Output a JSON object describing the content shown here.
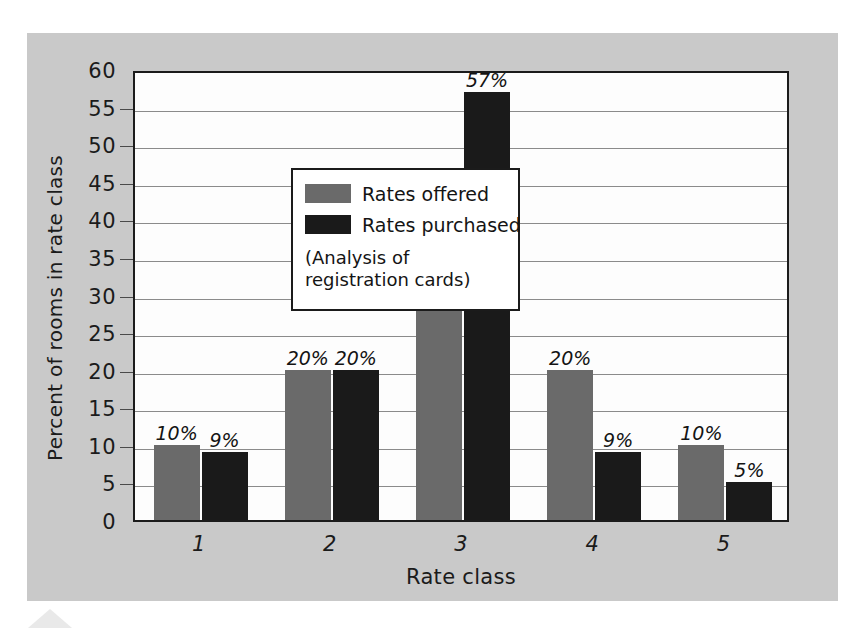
{
  "chart_data": {
    "type": "bar",
    "title": "",
    "xlabel": "Rate class",
    "ylabel": "Percent of rooms in rate class",
    "categories": [
      "1",
      "2",
      "3",
      "4",
      "5"
    ],
    "ylim": [
      0,
      60
    ],
    "ytick_step": 5,
    "yticks": [
      "60",
      "55",
      "50",
      "45",
      "40",
      "35",
      "30",
      "25",
      "20",
      "15",
      "10",
      "5",
      "0"
    ],
    "grid": true,
    "legend_position": "inside upper-left",
    "series": [
      {
        "name": "Rates offered",
        "color": "#6a6a6a",
        "values": [
          10,
          20,
          40,
          20,
          10
        ],
        "labels": [
          "10%",
          "20%",
          "40%",
          "20%",
          "10%"
        ]
      },
      {
        "name": "Rates purchased",
        "color": "#1a1a1a",
        "values": [
          9,
          20,
          57,
          9,
          5
        ],
        "labels": [
          "9%",
          "20%",
          "57%",
          "9%",
          "5%"
        ]
      }
    ],
    "annotations": [
      "(Analysis of registration cards)"
    ],
    "background_color": "#c9c9c9",
    "plot_background_color": "#fdfdfd"
  },
  "legend": {
    "note_line_1": "(Analysis of",
    "note_line_2": "registration cards)"
  }
}
